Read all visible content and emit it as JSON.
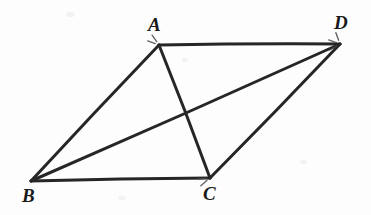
{
  "figure": {
    "kind": "geometry-diagram",
    "background_color": "#fdfdfd",
    "stroke_color": "#262626",
    "stroke_width": 3,
    "width": 371,
    "height": 215,
    "vertices": [
      {
        "id": "A",
        "label": "A",
        "x": 159,
        "y": 45,
        "label_x": 148,
        "label_y": 15
      },
      {
        "id": "B",
        "label": "B",
        "x": 31,
        "y": 181,
        "label_x": 22,
        "label_y": 186
      },
      {
        "id": "C",
        "label": "C",
        "x": 210,
        "y": 178,
        "label_x": 203,
        "label_y": 184
      },
      {
        "id": "D",
        "label": "D",
        "x": 340,
        "y": 44,
        "label_x": 334,
        "label_y": 13
      }
    ],
    "edges": [
      {
        "id": "AD",
        "from": "A",
        "to": "D",
        "role": "side"
      },
      {
        "id": "AB",
        "from": "A",
        "to": "B",
        "role": "side"
      },
      {
        "id": "BC",
        "from": "B",
        "to": "C",
        "role": "side"
      },
      {
        "id": "CD",
        "from": "C",
        "to": "D",
        "role": "side"
      },
      {
        "id": "AC",
        "from": "A",
        "to": "C",
        "role": "diagonal"
      },
      {
        "id": "BD",
        "from": "B",
        "to": "D",
        "role": "diagonal"
      }
    ],
    "diagonal_intersection": {
      "x": 185,
      "y": 113
    },
    "tick_marks": [
      {
        "at": "A",
        "count": 2
      },
      {
        "at": "C",
        "count": 2
      },
      {
        "at": "D",
        "count": 3
      }
    ]
  }
}
